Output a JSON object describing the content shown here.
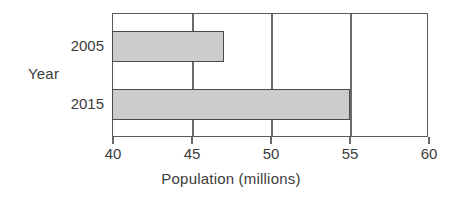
{
  "chart_data": {
    "type": "bar",
    "orientation": "horizontal",
    "title": "",
    "xlabel": "Population (millions)",
    "ylabel": "Year",
    "categories": [
      "2005",
      "2015"
    ],
    "values": [
      47,
      55
    ],
    "xlim": [
      40,
      60
    ],
    "xticks": [
      40,
      45,
      50,
      55,
      60
    ],
    "xtick_labels": [
      "40",
      "45",
      "50",
      "55",
      "60"
    ],
    "grid": true,
    "grid_axis": "x",
    "legend": false,
    "legend_position": "none",
    "series": [
      {
        "name": "Population",
        "values": [
          47,
          55
        ]
      }
    ],
    "colors": {
      "bar_fill": "#cccccc",
      "bar_border": "#4a4a4a",
      "axis": "#5a5a5a",
      "gridline": "#6a6a6a",
      "text": "#3c3c3c",
      "background": "#ffffff"
    }
  }
}
